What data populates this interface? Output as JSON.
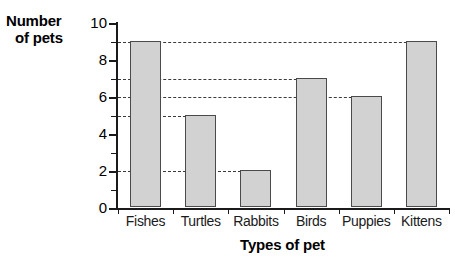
{
  "chart_data": {
    "type": "bar",
    "title": "",
    "xlabel": "Types of pet",
    "ylabel": "Number of pets",
    "ylabel_lines": [
      "Number",
      "of pets"
    ],
    "categories": [
      "Fishes",
      "Turtles",
      "Rabbits",
      "Birds",
      "Puppies",
      "Kittens"
    ],
    "values": [
      9,
      5,
      2,
      7,
      6,
      9
    ],
    "ylim": [
      0,
      10
    ],
    "ytick_labels": [
      "0",
      "2",
      "4",
      "6",
      "8",
      "10"
    ],
    "ytick_values": [
      0,
      2,
      4,
      6,
      8,
      10
    ],
    "yminor_values": [
      1,
      3,
      5,
      7,
      9
    ],
    "grid": true,
    "gridlines": [
      9,
      7,
      6,
      5,
      2
    ],
    "gridline_style": "dashed",
    "legend": null,
    "colors": {
      "bar_fill": "#d2d2d2",
      "bar_stroke": "#4a4a4a",
      "axis": "#1a1a1a",
      "grid": "#3a3a3a",
      "text": "#000000",
      "background": "#ffffff"
    }
  }
}
